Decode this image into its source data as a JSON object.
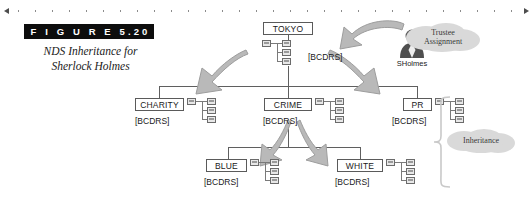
{
  "figure": {
    "label": "F I G U R E   5.20",
    "caption_line1": "NDS Inheritance for",
    "caption_line2": "Sherlock Holmes"
  },
  "diagram": {
    "nodes": [
      {
        "id": "tokyo",
        "name": "TOKYO",
        "rights": "[BCDRS]"
      },
      {
        "id": "charity",
        "name": "CHARITY",
        "rights": "[BCDRS]"
      },
      {
        "id": "crime",
        "name": "CRIME",
        "rights": "[BCDRS]"
      },
      {
        "id": "pr",
        "name": "PR",
        "rights": "[BCDRS]"
      },
      {
        "id": "blue",
        "name": "BLUE",
        "rights": "[BCDRS]"
      },
      {
        "id": "white",
        "name": "WHITE",
        "rights": "[BCDRS]"
      }
    ],
    "trustee": {
      "user": "SHolmes",
      "callout_line1": "Trustee",
      "callout_line2": "Assignment"
    },
    "inheritance_callout": "Inheritance",
    "colors": {
      "arrow_gray": "#b3b3b3",
      "blob_gray": "#d4d4d4",
      "line_gray": "#5f5f5f",
      "bar_black": "#0d0d0d"
    }
  }
}
